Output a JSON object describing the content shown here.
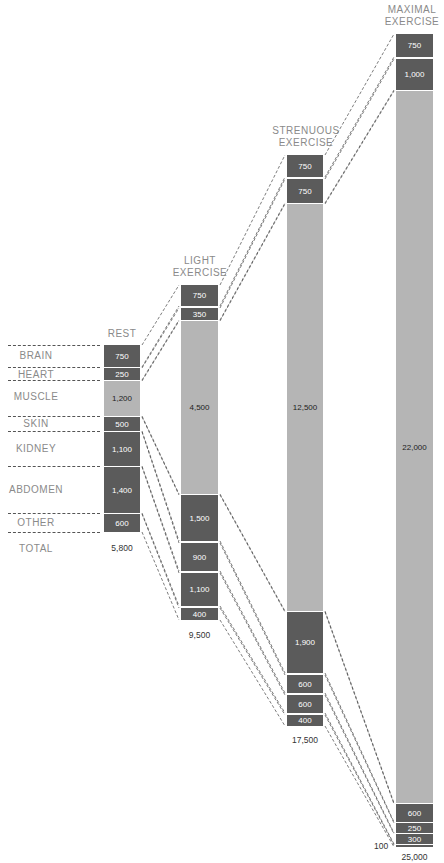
{
  "chart_data": {
    "type": "stacked-bar-flow",
    "organs": [
      "Brain",
      "Heart",
      "Muscle",
      "Skin",
      "Kidney",
      "Abdomen",
      "Other"
    ],
    "columns": [
      {
        "title": "REST",
        "values": {
          "Brain": 750,
          "Heart": 250,
          "Muscle": 1200,
          "Skin": 500,
          "Kidney": 1100,
          "Abdomen": 1400,
          "Other": 600
        },
        "total": "5,800"
      },
      {
        "title": "LIGHT EXERCISE",
        "values": {
          "Brain": 750,
          "Heart": 350,
          "Muscle": 4500,
          "Skin": 1500,
          "Kidney": 900,
          "Abdomen": 1100,
          "Other": 400
        },
        "total": "9,500"
      },
      {
        "title": "STRENUOUS EXERCISE",
        "values": {
          "Brain": 750,
          "Heart": 750,
          "Muscle": 12500,
          "Skin": 1900,
          "Kidney": 600,
          "Abdomen": 600,
          "Other": 400
        },
        "total": "17,500"
      },
      {
        "title": "MAXIMAL EXERCISE",
        "values": {
          "Brain": 750,
          "Heart": 1000,
          "Muscle": 22000,
          "Skin": 600,
          "Kidney": 250,
          "Abdomen": 300,
          "Other": 100
        },
        "total": "25,000"
      }
    ]
  },
  "labels": {
    "rest_title": "REST",
    "light_title": "LIGHT\nEXERCISE",
    "strenuous_title": "STRENUOUS\nEXERCISE",
    "maximal_title": "MAXIMAL\nEXERCISE",
    "organs": [
      "BRAIN",
      "HEART",
      "MUSCLE",
      "SKIN",
      "KIDNEY",
      "ABDOMEN",
      "OTHER"
    ],
    "total_label": "TOTAL"
  },
  "colors": {
    "dark": "#5b5b5b",
    "light": "#b5b5b5",
    "label": "#8a8a8a"
  },
  "bars": [
    {
      "x": 104,
      "w": 36,
      "segs": [
        {
          "y": 345,
          "h": 22,
          "label": "750",
          "tone": "dark"
        },
        {
          "y": 368,
          "h": 12,
          "label": "250",
          "tone": "dark"
        },
        {
          "y": 381,
          "h": 35,
          "label": "1,200",
          "tone": "light"
        },
        {
          "y": 417,
          "h": 14,
          "label": "500",
          "tone": "dark"
        },
        {
          "y": 432,
          "h": 34,
          "label": "1,100",
          "tone": "dark"
        },
        {
          "y": 467,
          "h": 46,
          "label": "1,400",
          "tone": "dark"
        },
        {
          "y": 514,
          "h": 18,
          "label": "600",
          "tone": "dark"
        }
      ],
      "total": {
        "y": 543,
        "label": "5,800"
      }
    },
    {
      "x": 181,
      "w": 37,
      "segs": [
        {
          "y": 285,
          "h": 21,
          "label": "750",
          "tone": "dark"
        },
        {
          "y": 308,
          "h": 12,
          "label": "350",
          "tone": "dark"
        },
        {
          "y": 321,
          "h": 173,
          "label": "4,500",
          "tone": "light"
        },
        {
          "y": 495,
          "h": 46,
          "label": "1,500",
          "tone": "dark"
        },
        {
          "y": 543,
          "h": 28,
          "label": "900",
          "tone": "dark"
        },
        {
          "y": 573,
          "h": 33,
          "label": "1,100",
          "tone": "dark"
        },
        {
          "y": 608,
          "h": 12,
          "label": "400",
          "tone": "dark"
        }
      ],
      "total": {
        "y": 630,
        "label": "9,500"
      }
    },
    {
      "x": 287,
      "w": 36,
      "segs": [
        {
          "y": 155,
          "h": 22,
          "label": "750",
          "tone": "dark"
        },
        {
          "y": 179,
          "h": 24,
          "label": "750",
          "tone": "dark"
        },
        {
          "y": 204,
          "h": 407,
          "label": "12,500",
          "tone": "light"
        },
        {
          "y": 612,
          "h": 61,
          "label": "1,900",
          "tone": "dark"
        },
        {
          "y": 675,
          "h": 18,
          "label": "600",
          "tone": "dark"
        },
        {
          "y": 695,
          "h": 18,
          "label": "600",
          "tone": "dark"
        },
        {
          "y": 715,
          "h": 11,
          "label": "400",
          "tone": "dark"
        }
      ],
      "total": {
        "y": 735,
        "label": "17,500"
      }
    },
    {
      "x": 396,
      "w": 37,
      "segs": [
        {
          "y": 34,
          "h": 23,
          "label": "750",
          "tone": "dark"
        },
        {
          "y": 59,
          "h": 31,
          "label": "1,000",
          "tone": "dark"
        },
        {
          "y": 91,
          "h": 712,
          "label": "22,000",
          "tone": "light"
        },
        {
          "y": 804,
          "h": 18,
          "label": "600",
          "tone": "dark"
        },
        {
          "y": 823,
          "h": 10,
          "label": "250",
          "tone": "dark"
        },
        {
          "y": 834,
          "h": 10,
          "label": "300",
          "tone": "dark"
        },
        {
          "y": 845,
          "h": 2,
          "label": "",
          "tone": "dark"
        }
      ],
      "total": {
        "y": 852,
        "label": "25,000"
      },
      "small_label": {
        "x": 374,
        "y": 841,
        "label": "100"
      }
    }
  ],
  "organ_rows": [
    {
      "label_y": 350,
      "dash_y": 345
    },
    {
      "label_y": 369,
      "dash_y": 367
    },
    {
      "label_y": 391,
      "dash_y": 380
    },
    {
      "label_y": 418,
      "dash_y": 416
    },
    {
      "label_y": 443,
      "dash_y": 431
    },
    {
      "label_y": 484,
      "dash_y": 466
    },
    {
      "label_y": 517,
      "dash_y": 513
    }
  ],
  "organ_bottom_dash_y": 532,
  "total_label_y": 543
}
